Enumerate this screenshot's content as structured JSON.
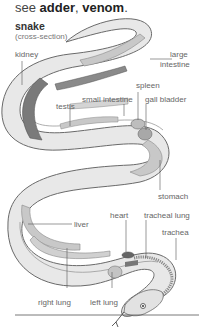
{
  "header": {
    "see_prefix": "see ",
    "see_link_1": "adder",
    "see_sep": ", ",
    "see_link_2": "venom",
    "see_suffix": "."
  },
  "diagram": {
    "title": "snake",
    "subtitle": "(cross-section)",
    "labels": {
      "kidney": "kidney",
      "large_intestine_1": "large",
      "large_intestine_2": "intestine",
      "spleen": "spleen",
      "small_intestine": "small intestine",
      "gall_bladder": "gall bladder",
      "testis": "testis",
      "stomach": "stomach",
      "liver": "liver",
      "heart": "heart",
      "tracheal_lung": "tracheal lung",
      "trachea": "trachea",
      "right_lung": "right lung",
      "left_lung": "left lung"
    },
    "colors": {
      "body_fill": "#e8e8e8",
      "body_stroke": "#6a6a6a",
      "organ_light": "#c8c8c8",
      "organ_dark": "#7a7a7a",
      "leader_line": "#555555"
    }
  }
}
